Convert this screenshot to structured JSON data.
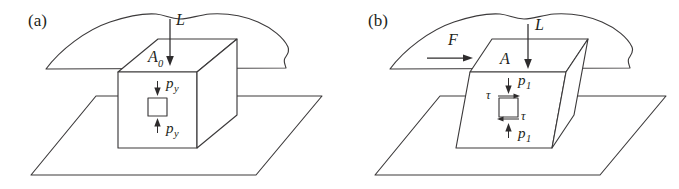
{
  "figure": {
    "type": "engineering-diagram",
    "background_color": "#ffffff",
    "line_color": "#3c3a3b",
    "text_color": "#231f20"
  },
  "panels": [
    {
      "id": "a",
      "label": "(a)",
      "labels": {
        "load": "L",
        "area": "A",
        "area_sub": "0",
        "pressure_top": "p",
        "pressure_top_sub": "y",
        "pressure_bottom": "p",
        "pressure_bottom_sub": "y"
      },
      "arrows": [
        {
          "name": "load-arrow",
          "symbol": "L",
          "direction": "down"
        },
        {
          "name": "pressure-top-arrow",
          "symbol": "p_y",
          "direction": "down"
        },
        {
          "name": "pressure-bottom-arrow",
          "symbol": "p_y",
          "direction": "up"
        }
      ],
      "elements": [
        "wavy-upper-surface",
        "indenter-block",
        "lower-ground-plane",
        "stress-element-square"
      ]
    },
    {
      "id": "b",
      "label": "(b)",
      "labels": {
        "shear_force": "F",
        "load": "L",
        "area": "A",
        "pressure_top": "p",
        "pressure_top_sub": "1",
        "pressure_bottom": "p",
        "pressure_bottom_sub": "1",
        "shear_top": "τ",
        "shear_bottom": "τ"
      },
      "arrows": [
        {
          "name": "shear-force-arrow",
          "symbol": "F",
          "direction": "right"
        },
        {
          "name": "load-arrow",
          "symbol": "L",
          "direction": "down"
        },
        {
          "name": "pressure-top-arrow",
          "symbol": "p_1",
          "direction": "down"
        },
        {
          "name": "pressure-bottom-arrow",
          "symbol": "p_1",
          "direction": "up"
        },
        {
          "name": "shear-top-arrow",
          "symbol": "tau",
          "direction": "right"
        },
        {
          "name": "shear-bottom-arrow",
          "symbol": "tau",
          "direction": "left"
        }
      ],
      "elements": [
        "wavy-upper-surface",
        "sheared-indenter-block",
        "lower-ground-plane",
        "stress-element-square"
      ]
    }
  ]
}
